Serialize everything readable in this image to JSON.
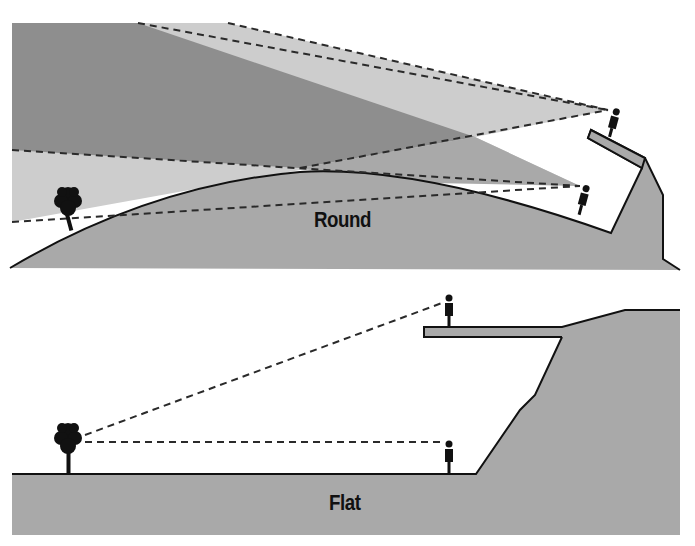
{
  "figure": {
    "type": "line-of-sight comparison illustration",
    "panels": [
      {
        "id": "round",
        "label": "Round",
        "elements": [
          "tree",
          "person-on-ground",
          "person-on-cliff-ledge",
          "curved-hill",
          "cliff",
          "sightline-cone-upper",
          "sightline-cone-lower"
        ]
      },
      {
        "id": "flat",
        "label": "Flat",
        "elements": [
          "tree",
          "person-on-ground",
          "person-on-cliff-ledge",
          "flat-ground",
          "cliff",
          "sightline-to-ledge",
          "sightline-to-ground"
        ]
      }
    ]
  },
  "labels": {
    "round": "Round",
    "flat": "Flat"
  },
  "colors": {
    "ground": "#a9a9a9",
    "shadow_dark": "#8e8e8e",
    "shadow_light": "#cdcdcd",
    "outline": "#111111",
    "dash": "#2a2a2a",
    "background": "#ffffff"
  }
}
